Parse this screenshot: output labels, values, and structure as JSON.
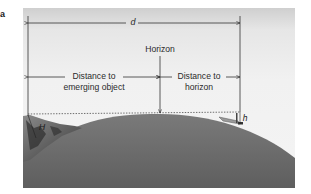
{
  "figure": {
    "panel_label": "a",
    "labels": {
      "total_distance": "d",
      "horizon": "Horizon",
      "distance_to_emerging_object_line1": "Distance to",
      "distance_to_emerging_object_line2": "emerging object",
      "distance_to_horizon_line1": "Distance to",
      "distance_to_horizon_line2": "horizon",
      "observer_height": "H",
      "object_height": "h"
    },
    "colors": {
      "sky": "#f1f1f1",
      "sea": "#6f6f6f",
      "lines": "#333333"
    }
  }
}
